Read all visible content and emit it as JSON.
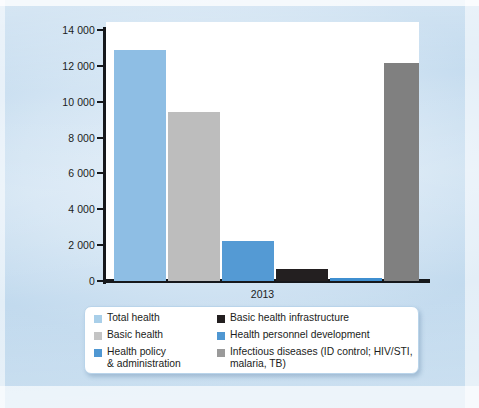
{
  "chart_data": {
    "type": "bar",
    "title": "",
    "subtitle": "",
    "xlabel": "2013",
    "ylabel": "",
    "ylim": [
      0,
      14000
    ],
    "grid": false,
    "legend_position": "bottom",
    "categories": [
      "2013"
    ],
    "y_ticks": [
      {
        "value": 14000,
        "label": "14 000"
      },
      {
        "value": 12000,
        "label": "12 000"
      },
      {
        "value": 10000,
        "label": "10 000"
      },
      {
        "value": 8000,
        "label": "8 000"
      },
      {
        "value": 6000,
        "label": "6 000"
      },
      {
        "value": 4000,
        "label": "4 000"
      },
      {
        "value": 2000,
        "label": "2 000"
      },
      {
        "value": 0,
        "label": "0"
      }
    ],
    "series": [
      {
        "name": "Total health",
        "color": "#8ebee4",
        "values": [
          12880
        ]
      },
      {
        "name": "Basic health",
        "color": "#bdbdbd",
        "values": [
          9430
        ]
      },
      {
        "name": "Health policy & administration",
        "color": "#549ad4",
        "values": [
          2230
        ]
      },
      {
        "name": "Basic health infrastructure",
        "color": "#231f20",
        "values": [
          670
        ]
      },
      {
        "name": "Health personnel development",
        "color": "#3f8fd0",
        "values": [
          150
        ]
      },
      {
        "name": "Infectious diseases (ID control; HIV/STI, malaria, TB)",
        "color": "#808080",
        "values": [
          12160
        ]
      }
    ]
  },
  "legend": {
    "left_column": [
      {
        "label": "Total health",
        "color": "#a9cfe9"
      },
      {
        "label": "Basic health",
        "color": "#c4c4c4"
      },
      {
        "label": "Health policy\n& administration",
        "color": "#4f97d2"
      }
    ],
    "right_column": [
      {
        "label": "Basic health infrastructure",
        "color": "#231f20"
      },
      {
        "label": "Health personnel development",
        "color": "#4f97d2"
      },
      {
        "label": "Infectious diseases (ID control; HIV/STI, malaria, TB)",
        "color": "#9a9a9a"
      }
    ]
  },
  "axis": {
    "x_category_label": "2013"
  },
  "colors": {
    "background": "#c7dced",
    "plot_background": "#ffffff",
    "axis": "#16181c",
    "legend_border": "#b9d4ea"
  }
}
